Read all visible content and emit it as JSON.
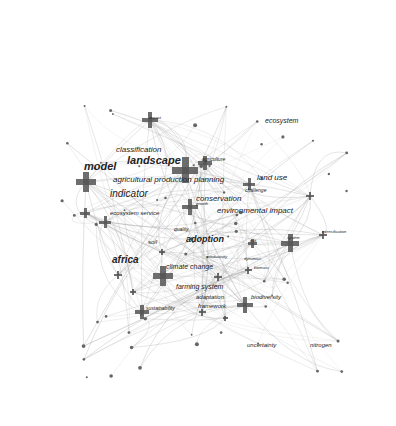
{
  "diagram": {
    "type": "keyword co-occurrence network",
    "labels": [
      {
        "text": "model",
        "x": 84,
        "y": 172,
        "size": 11,
        "bold": true
      },
      {
        "text": "landscape",
        "x": 127,
        "y": 166,
        "size": 11,
        "bold": true
      },
      {
        "text": "classification",
        "x": 116,
        "y": 154,
        "size": 8
      },
      {
        "text": "agricultural production planning",
        "x": 113,
        "y": 184,
        "size": 8
      },
      {
        "text": "indicator",
        "x": 110,
        "y": 199,
        "size": 10
      },
      {
        "text": "ecosystem service",
        "x": 110,
        "y": 216,
        "size": 6
      },
      {
        "text": "conservation",
        "x": 196,
        "y": 203,
        "size": 8
      },
      {
        "text": "agriculture",
        "x": 202,
        "y": 162,
        "size": 5
      },
      {
        "text": "land use",
        "x": 257,
        "y": 182,
        "size": 8
      },
      {
        "text": "challenge",
        "x": 245,
        "y": 193,
        "size": 5
      },
      {
        "text": "environmental impact",
        "x": 217,
        "y": 215,
        "size": 8
      },
      {
        "text": "quality",
        "x": 174,
        "y": 232,
        "size": 5
      },
      {
        "text": "adoption",
        "x": 186,
        "y": 244,
        "size": 9,
        "bold": true
      },
      {
        "text": "soil",
        "x": 148,
        "y": 245,
        "size": 6
      },
      {
        "text": "africa",
        "x": 112,
        "y": 265,
        "size": 10,
        "bold": true
      },
      {
        "text": "climate change",
        "x": 166,
        "y": 270,
        "size": 7
      },
      {
        "text": "farming system",
        "x": 176,
        "y": 290,
        "size": 7
      },
      {
        "text": "adaptation",
        "x": 196,
        "y": 300,
        "size": 6
      },
      {
        "text": "framework",
        "x": 198,
        "y": 309,
        "size": 6
      },
      {
        "text": "sustainability",
        "x": 146,
        "y": 311,
        "size": 5
      },
      {
        "text": "biodiversity",
        "x": 251,
        "y": 300,
        "size": 6
      },
      {
        "text": "uncertainty",
        "x": 247,
        "y": 348,
        "size": 6
      },
      {
        "text": "nitrogen",
        "x": 310,
        "y": 348,
        "size": 6
      },
      {
        "text": "ecosystem",
        "x": 265,
        "y": 124,
        "size": 7
      },
      {
        "text": "impact",
        "x": 149,
        "y": 120,
        "size": 4
      },
      {
        "text": "system",
        "x": 287,
        "y": 240,
        "size": 4
      },
      {
        "text": "intensification",
        "x": 322,
        "y": 234,
        "size": 4
      },
      {
        "text": "productivity",
        "x": 207,
        "y": 259,
        "size": 4
      },
      {
        "text": "dynamics",
        "x": 244,
        "y": 261,
        "size": 4
      },
      {
        "text": "risk",
        "x": 250,
        "y": 243,
        "size": 4
      },
      {
        "text": "growth",
        "x": 196,
        "y": 206,
        "size": 4
      },
      {
        "text": "biomass",
        "x": 254,
        "y": 270,
        "size": 4
      }
    ],
    "crosses": [
      {
        "x": 185,
        "y": 170,
        "size": 26
      },
      {
        "x": 86,
        "y": 182,
        "size": 20
      },
      {
        "x": 150,
        "y": 120,
        "size": 16
      },
      {
        "x": 205,
        "y": 163,
        "size": 14
      },
      {
        "x": 190,
        "y": 207,
        "size": 16
      },
      {
        "x": 249,
        "y": 184,
        "size": 12
      },
      {
        "x": 105,
        "y": 222,
        "size": 12
      },
      {
        "x": 85,
        "y": 213,
        "size": 10
      },
      {
        "x": 163,
        "y": 276,
        "size": 20
      },
      {
        "x": 290,
        "y": 243,
        "size": 18
      },
      {
        "x": 245,
        "y": 305,
        "size": 16
      },
      {
        "x": 142,
        "y": 312,
        "size": 14
      },
      {
        "x": 118,
        "y": 275,
        "size": 8
      },
      {
        "x": 252,
        "y": 243,
        "size": 9
      },
      {
        "x": 323,
        "y": 235,
        "size": 8
      },
      {
        "x": 310,
        "y": 196,
        "size": 8
      },
      {
        "x": 218,
        "y": 277,
        "size": 8
      },
      {
        "x": 133,
        "y": 292,
        "size": 6
      },
      {
        "x": 248,
        "y": 270,
        "size": 7
      },
      {
        "x": 202,
        "y": 312,
        "size": 7
      },
      {
        "x": 225,
        "y": 318,
        "size": 5
      },
      {
        "x": 162,
        "y": 252,
        "size": 6
      }
    ],
    "colors": {
      "node": "#555555",
      "edge": "#9a9a9a",
      "label": "#222222",
      "background": "#ffffff"
    }
  }
}
